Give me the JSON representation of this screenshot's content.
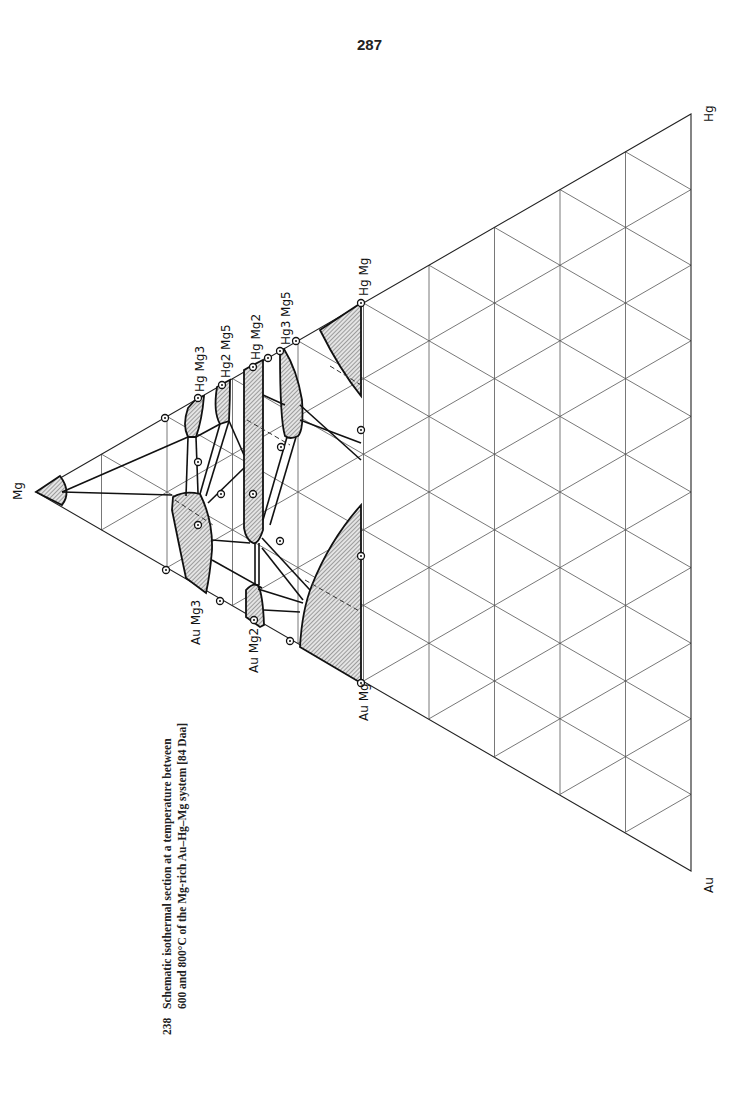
{
  "page": {
    "number": "287"
  },
  "caption": {
    "figure_number": "238",
    "line1": "Schematic isothermal section at a temperature between",
    "line2": "600 and 800°C of the Mg-rich Au–Hg–Mg system [84 Daa]"
  },
  "diagram": {
    "type": "ternary phase diagram (isothermal section)",
    "orientation": "rotated 90° counter-clockwise",
    "corners": {
      "top": "Hg",
      "bottom": "Au",
      "apex_left": "Mg"
    },
    "grid_divisions": 10,
    "phase_labels": {
      "au_mg": "Au Mg",
      "au_mg2": "Au Mg2",
      "au_mg3": "Au Mg3",
      "hg_mg": "Hg Mg",
      "hg3_mg5": "Hg3 Mg5",
      "hg_mg2": "Hg Mg2",
      "hg2_mg5": "Hg2 Mg5",
      "hg_mg3": "Hg Mg3",
      "mg": "Mg",
      "hg": "Hg",
      "au": "Au"
    },
    "label_parts": {
      "au": "Au",
      "hg": "Hg",
      "mg": "Mg",
      "sub2": "2",
      "sub3": "3",
      "sub5": "5"
    }
  }
}
